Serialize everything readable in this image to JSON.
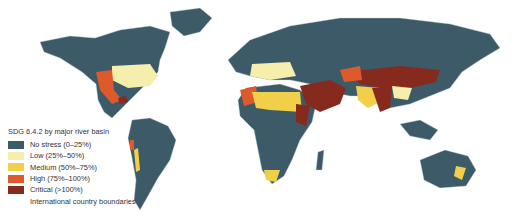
{
  "legend": {
    "title": "SDG 6.4.2 by major river basin",
    "items": [
      {
        "label": "No stress (0–25%)",
        "color": "#3d5a68"
      },
      {
        "label": "Low (25%–50%)",
        "color": "#f6eeac"
      },
      {
        "label": "Medium (50%–75%)",
        "color": "#f2cf48"
      },
      {
        "label": "High (75%–100%)",
        "color": "#de5a2c"
      },
      {
        "label": "Critical (>100%)",
        "color": "#862a1e"
      },
      {
        "label": "International country boundaries",
        "color": ""
      }
    ]
  },
  "colors": {
    "none": "#3d5a68",
    "low": "#f6eeac",
    "medium": "#f2cf48",
    "high": "#de5a2c",
    "critical": "#862a1e",
    "boundary": "#c8d3d8",
    "background": "#ffffff"
  }
}
